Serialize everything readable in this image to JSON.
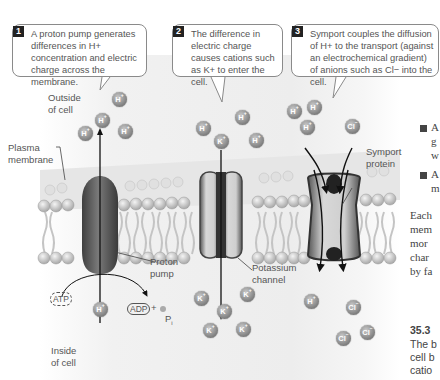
{
  "callouts": [
    {
      "number": "1",
      "text": "A proton pump generates differences in H+ concentration and electric charge across the membrane."
    },
    {
      "number": "2",
      "text": "The difference in electric charge causes cations such as K+ to enter the cell."
    },
    {
      "number": "3",
      "text": "Symport couples the diffusion of H+ to the transport (against an electrochemical gradient) of anions such as Cl− into the cell."
    }
  ],
  "labels": {
    "outside": [
      "Outside",
      "of cell"
    ],
    "inside": [
      "Inside",
      "of cell"
    ],
    "plasma_membrane": [
      "Plasma",
      "membrane"
    ],
    "proton_pump": [
      "Proton",
      "pump"
    ],
    "potassium_channel": [
      "Potassium",
      "channel"
    ],
    "symport_protein": [
      "Symport",
      "protein"
    ],
    "atp": "ATP",
    "adp": "ADP",
    "plus": "+",
    "pi": "P",
    "pi_sub": "i"
  },
  "ions": {
    "h": "H",
    "h_charge": "+",
    "k": "K",
    "k_charge": "+",
    "cl": "Cl",
    "cl_charge": "−"
  },
  "side_text": {
    "bullet1": [
      "A",
      "g",
      "w"
    ],
    "bullet2": [
      "A",
      "m"
    ],
    "paragraph": [
      "Each",
      "mem",
      "mor",
      "char",
      "by fa"
    ],
    "section_number": "35.3",
    "section_lines": [
      "The b",
      "cell b",
      "catio"
    ]
  },
  "colors": {
    "callout_border": "#8a8a8a",
    "number_box": "#222222",
    "ion_fill": "#8e8e8e",
    "protein_dark": "#555555",
    "membrane": "#d6d6d6"
  }
}
